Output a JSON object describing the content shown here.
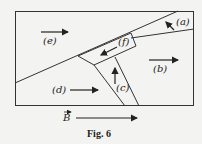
{
  "figure": {
    "caption": "Fig. 6",
    "field_label": "B",
    "regions": {
      "a": "(a)",
      "b": "(b)",
      "c": "(c)",
      "d": "(d)",
      "e": "(e)",
      "f": "(f)"
    }
  }
}
